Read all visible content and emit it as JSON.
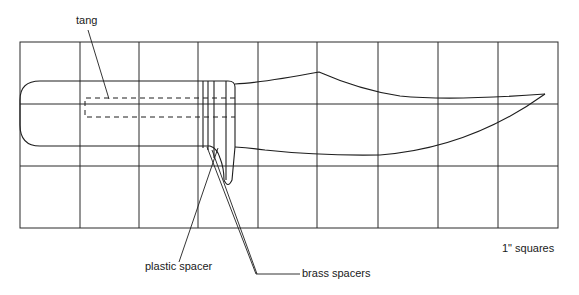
{
  "diagram": {
    "grid": {
      "columns": 9,
      "rows": 3,
      "scale_note": "1\" squares"
    },
    "labels": {
      "tang": "tang",
      "plastic_spacer": "plastic spacer",
      "brass_spacers": "brass spacers",
      "scale": "1\" squares"
    },
    "colors": {
      "line": "#1e1e1e",
      "background": "#ffffff"
    }
  }
}
